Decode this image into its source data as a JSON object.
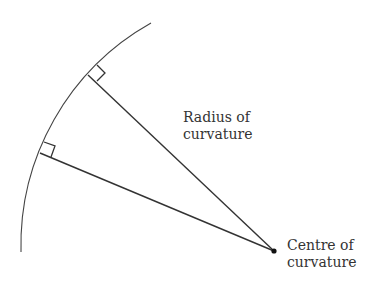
{
  "diagram": {
    "labels": {
      "radius": [
        "Radius of",
        "curvature"
      ],
      "centre": [
        "Centre of",
        "curvature"
      ]
    },
    "colors": {
      "line": "#333333",
      "background": "#ffffff"
    },
    "geometry": {
      "centre": [
        274,
        251
      ],
      "radius": 255,
      "arc_start": [
        151,
        23
      ],
      "arc_end": [
        21,
        252
      ],
      "radii_endpoints": [
        [
          88,
          75
        ],
        [
          40,
          153
        ]
      ]
    }
  }
}
